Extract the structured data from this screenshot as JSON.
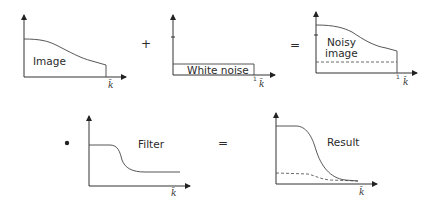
{
  "panels": [
    {
      "id": "image",
      "label": "Image",
      "axis_label": "k̄"
    },
    {
      "id": "white-noise",
      "label": "White noise",
      "axis_label": "k̄",
      "tick": "1"
    },
    {
      "id": "noisy-image",
      "label_line1": "Noisy",
      "label_line2": "image",
      "axis_label": "k̄",
      "tick": "1"
    },
    {
      "id": "filter",
      "label": "Filter",
      "axis_label": "k̄"
    },
    {
      "id": "result",
      "label": "Result",
      "axis_label": "k̄"
    }
  ],
  "operators": {
    "plus": "+",
    "equals1": "=",
    "multiply": "•",
    "equals2": "="
  }
}
